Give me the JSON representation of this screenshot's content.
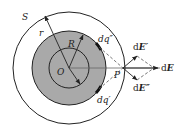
{
  "figure": {
    "labels": {
      "surface": "S",
      "outer_radius": "r",
      "sphere_radius": "R",
      "center": "O",
      "point": "P",
      "charge_upper": "dq″",
      "charge_lower": "dq′",
      "field_upper_d": "d",
      "field_upper_E": "E′",
      "field_lower_d": "d",
      "field_lower_E": "E″",
      "field_total_d": "d",
      "field_total_E": "E"
    },
    "colors": {
      "sphere_fill": "#a9a9a9",
      "stroke": "#222222",
      "dashed": "#555555"
    }
  }
}
